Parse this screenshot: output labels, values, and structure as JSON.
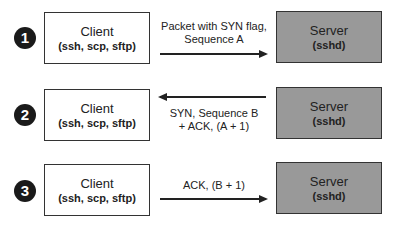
{
  "diagram": {
    "steps": [
      {
        "number": "1",
        "client_title": "Client",
        "client_sub": "(ssh, scp, sftp)",
        "server_title": "Server",
        "server_sub": "(sshd)",
        "label_line1": "Packet with SYN flag,",
        "label_line2": "Sequence A",
        "direction": "client-to-server"
      },
      {
        "number": "2",
        "client_title": "Client",
        "client_sub": "(ssh, scp, sftp)",
        "server_title": "Server",
        "server_sub": "(sshd)",
        "label_line1": "SYN, Sequence B",
        "label_line2": "+ ACK, (A + 1)",
        "direction": "server-to-client"
      },
      {
        "number": "3",
        "client_title": "Client",
        "client_sub": "(ssh, scp, sftp)",
        "server_title": "Server",
        "server_sub": "(sshd)",
        "label_line1": "ACK, (B + 1)",
        "label_line2": "",
        "direction": "client-to-server"
      }
    ],
    "colors": {
      "client_fill": "#ffffff",
      "server_fill": "#999999",
      "step_badge": "#1a1a1a"
    }
  }
}
